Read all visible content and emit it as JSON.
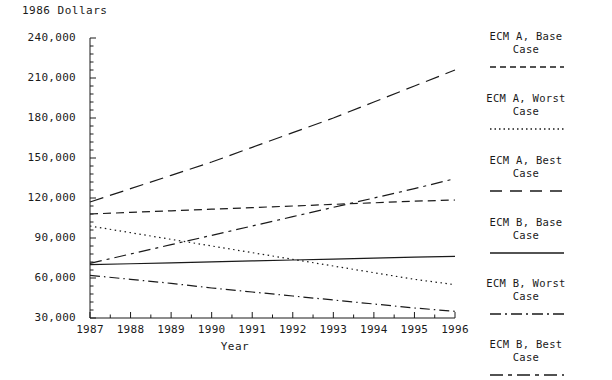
{
  "chart_data": {
    "type": "line",
    "title": "",
    "ylabel": "1986 Dollars",
    "xlabel": "Year",
    "grid": false,
    "legend_position": "right",
    "x": [
      1987,
      1988,
      1989,
      1990,
      1991,
      1992,
      1993,
      1994,
      1995,
      1996
    ],
    "categories": [
      "1987",
      "1988",
      "1989",
      "1990",
      "1991",
      "1992",
      "1993",
      "1994",
      "1995",
      "1996"
    ],
    "xlim": [
      1987,
      1996
    ],
    "ylim": [
      30000,
      240000
    ],
    "ytick_labels": [
      "240,000",
      "210,000",
      "180,000",
      "150,000",
      "120,000",
      "90,000",
      "60,000",
      "30,000"
    ],
    "ytick_values": [
      240000,
      210000,
      180000,
      150000,
      120000,
      90000,
      60000,
      30000
    ],
    "yminor_step": 6000,
    "series": [
      {
        "name": "ECM A, Base Case",
        "dash": "8,5",
        "values": [
          108000,
          109200,
          110400,
          111600,
          112800,
          114000,
          115200,
          116400,
          117600,
          118500
        ]
      },
      {
        "name": "ECM A, Worst Case",
        "dash": "1.5,3.5",
        "values": [
          99000,
          94000,
          89000,
          84000,
          79000,
          74000,
          69000,
          64000,
          59000,
          55000
        ]
      },
      {
        "name": "ECM A, Best Case",
        "dash": "14,7",
        "values": [
          117000,
          127000,
          137000,
          147000,
          158000,
          169000,
          180000,
          192000,
          204000,
          216000
        ]
      },
      {
        "name": "ECM B, Base Case",
        "dash": "0",
        "values": [
          70000,
          70700,
          71400,
          72100,
          72800,
          73500,
          74200,
          74900,
          75600,
          76200
        ]
      },
      {
        "name": "ECM B, Worst Case",
        "dash": "10,4,1.5,4",
        "values": [
          62000,
          59000,
          56000,
          52500,
          49500,
          46500,
          43500,
          40500,
          37500,
          35000
        ]
      },
      {
        "name": "ECM B, Best Case",
        "dash": "12,5,3,5",
        "values": [
          71000,
          78000,
          85000,
          92000,
          99000,
          106000,
          113000,
          120000,
          127000,
          134500
        ]
      }
    ]
  },
  "legend": {
    "items": [
      {
        "line1": "ECM A, Base",
        "line2": "Case",
        "swatch": "dashed-short"
      },
      {
        "line1": "ECM A, Worst",
        "line2": "Case",
        "swatch": "dotted"
      },
      {
        "line1": "ECM A, Best",
        "line2": "Case",
        "swatch": "dashed-long"
      },
      {
        "line1": "ECM B, Base",
        "line2": "Case",
        "swatch": "solid"
      },
      {
        "line1": "ECM B, Worst",
        "line2": "Case",
        "swatch": "dash-dot"
      },
      {
        "line1": "ECM B, Best",
        "line2": "Case",
        "swatch": "dash-dot-dash"
      }
    ]
  },
  "colors": {
    "ink": "#1a1a1a",
    "background": "#ffffff"
  }
}
